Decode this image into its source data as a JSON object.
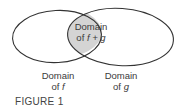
{
  "diagram": {
    "type": "venn",
    "sets": [
      {
        "name": "domain-f",
        "label_line1": "Domain",
        "label_line2_prefix": "of ",
        "label_var": "f"
      },
      {
        "name": "domain-g",
        "label_line1": "Domain",
        "label_line2_prefix": "of ",
        "label_var": "g"
      }
    ],
    "intersection": {
      "label_line1": "Domain",
      "label_line2_prefix": "of ",
      "label_expr": "f + g",
      "fill": "#d4d4d4"
    },
    "stroke_color": "#333333"
  },
  "caption": "FIGURE 1"
}
